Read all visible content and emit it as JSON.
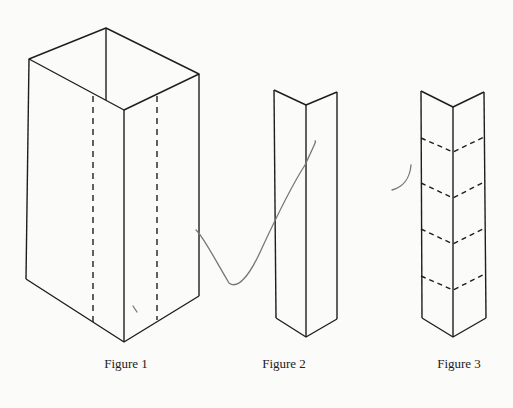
{
  "figures": [
    {
      "id": "figure-1",
      "label": "Figure 1",
      "description": "Open rectangular box in perspective with two vertical dashed fold lines"
    },
    {
      "id": "figure-2",
      "label": "Figure 2",
      "description": "Tall V-shaped folded strip (angle)"
    },
    {
      "id": "figure-3",
      "label": "Figure 3",
      "description": "Tall V-shaped folded strip with four dashed chevron fold lines"
    }
  ],
  "colors": {
    "line": "#1e1e1e",
    "background": "#fbfbfa",
    "pencil": "#777777"
  }
}
